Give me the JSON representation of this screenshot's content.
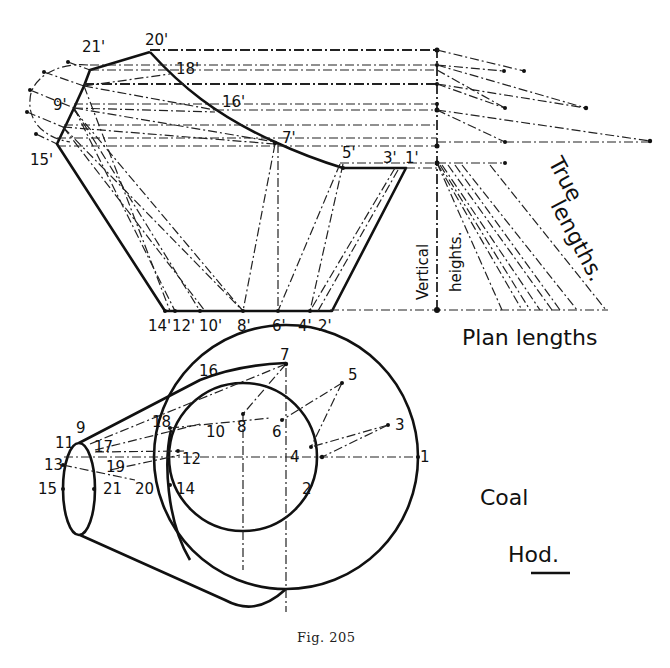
{
  "figure": {
    "caption": "Fig. 205",
    "title_line1": "Coal",
    "title_line2": "Hod."
  },
  "elevation": {
    "labels": {
      "p21": "21'",
      "p20": "20'",
      "p18": "18'",
      "p16": "16'",
      "p9": "9'",
      "p15": "15'",
      "p7": "7'",
      "p5": "5'",
      "p3": "3'",
      "p1": "1'",
      "p14": "14'",
      "p12": "12'",
      "p10": "10'",
      "p8": "8'",
      "p6": "6'",
      "p4": "4'",
      "p2": "2'"
    }
  },
  "true_length_diagram": {
    "vertical_label": "Vertical",
    "heights_label": "heights.",
    "true_label_1": "True",
    "true_label_2": "lengths.",
    "plan_label": "Plan lengths"
  },
  "plan": {
    "labels": {
      "n1": "1",
      "n2": "2",
      "n3": "3",
      "n4": "4",
      "n5": "5",
      "n6": "6",
      "n7": "7",
      "n8": "8",
      "n9": "9",
      "n10": "10",
      "n11": "11",
      "n12": "12",
      "n13": "13",
      "n14": "14",
      "n15": "15",
      "n16": "16",
      "n17": "17",
      "n18": "18",
      "n19": "19",
      "n20": "20",
      "n21": "21"
    }
  }
}
